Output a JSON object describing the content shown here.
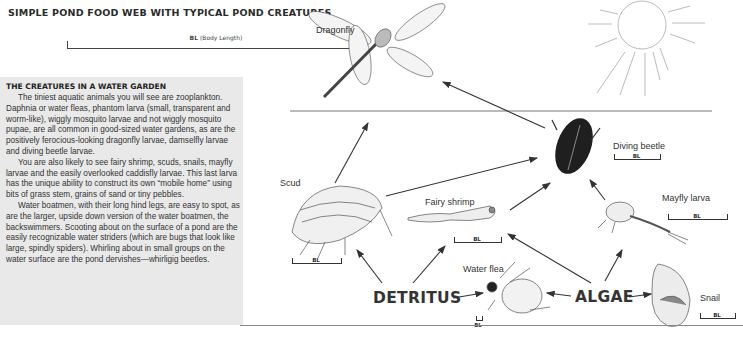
{
  "header": {
    "title": "SIMPLE POND FOOD WEB WITH TYPICAL POND CREATURES",
    "legend_bl_abbr": "BL",
    "legend_bl_text": "(Body Length)"
  },
  "sidebar": {
    "title": "THE CREATURES IN A WATER GARDEN",
    "paragraphs": [
      "The tiniest aquatic animals you will see are zooplankton. Daphnia or water fleas, phantom larva (small, transparent and worm-like), wiggly mosquito larvae and not wiggly mosquito pupae, are all common in good-sized water gardens, as are the positively ferocious-looking dragonfly larvae, damselfly larvae and diving beetle larvae.",
      "You are also likely to see fairy shrimp, scuds, snails, mayfly larvae and the easily overlooked caddisfly larvae. This last larva has the unique ability to construct its own “mobile home” using bits of grass stem, grains of sand or tiny pebbles.",
      "Water boatmen, with their long hind legs, are easy to spot, as are the larger, upside down version of the water boatmen, the backswimmers. Scooting about on the surface of a pond are the easily recognizable water striders (which are bugs that look like large, spindly spiders). Whirling about in small groups on the water surface are the pond dervishes—whirligig beetles."
    ]
  },
  "diagram": {
    "bl_label": "BL",
    "sources": {
      "detritus": "DETRITUS",
      "algae": "ALGAE"
    },
    "creatures": [
      {
        "id": "dragonfly",
        "label": "Dragonfly"
      },
      {
        "id": "diving-beetle",
        "label": "Diving beetle"
      },
      {
        "id": "scud",
        "label": "Scud"
      },
      {
        "id": "fairy-shrimp",
        "label": "Fairy shrimp"
      },
      {
        "id": "mayfly-larva",
        "label": "Mayfly larva"
      },
      {
        "id": "water-flea",
        "label": "Water flea"
      },
      {
        "id": "snail",
        "label": "Snail"
      }
    ],
    "edges": [
      {
        "from": "diving-beetle",
        "to": "dragonfly"
      },
      {
        "from": "scud",
        "to": "dragonfly"
      },
      {
        "from": "scud",
        "to": "diving-beetle"
      },
      {
        "from": "fairy-shrimp",
        "to": "diving-beetle"
      },
      {
        "from": "mayfly-larva",
        "to": "diving-beetle"
      },
      {
        "from": "detritus",
        "to": "scud"
      },
      {
        "from": "detritus",
        "to": "fairy-shrimp"
      },
      {
        "from": "detritus",
        "to": "water-flea"
      },
      {
        "from": "algae",
        "to": "fairy-shrimp"
      },
      {
        "from": "algae",
        "to": "mayfly-larva"
      },
      {
        "from": "algae",
        "to": "water-flea"
      },
      {
        "from": "algae",
        "to": "snail"
      }
    ]
  }
}
